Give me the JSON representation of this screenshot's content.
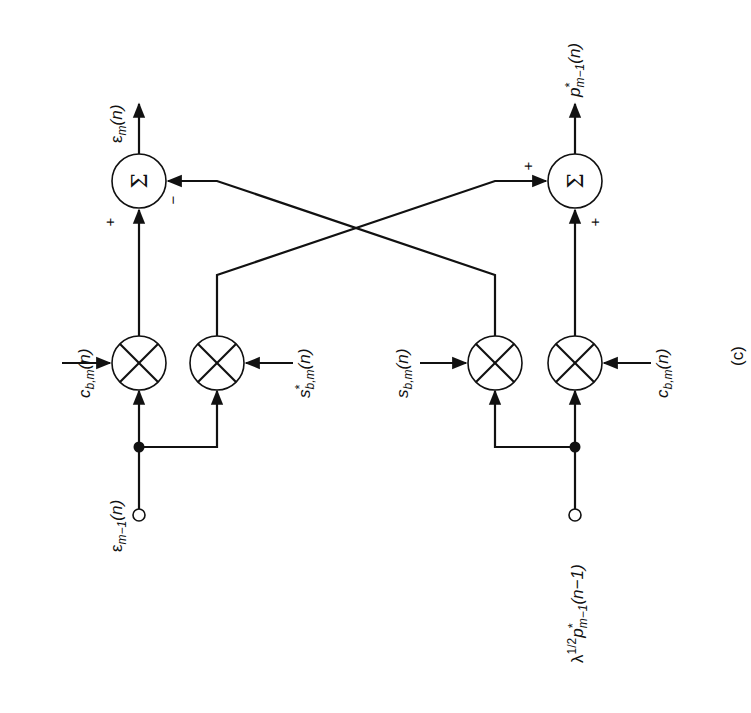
{
  "figure": {
    "panel_label": "(c)",
    "orientation": "rotated 90 degrees counter-clockwise",
    "colors": {
      "ink": "#111111",
      "background": "#ffffff"
    }
  },
  "inputs": {
    "top": {
      "label": "ε m−1(n)",
      "base": "ε",
      "sub": "m−1",
      "arg": "(n)"
    },
    "bottom": {
      "label": "λ1/2 p*m−1(n−1)",
      "pre": "λ",
      "sup": "1/2",
      "base": "p",
      "star": "*",
      "sub": "m−1",
      "arg": "(n−1)"
    }
  },
  "outputs": {
    "top": {
      "label": "ε m(n)",
      "base": "ε",
      "sub": "m",
      "arg": "(n)"
    },
    "bottom": {
      "label": "p*m−1(n)",
      "base": "p",
      "star": "*",
      "sub": "m−1",
      "arg": "(n)"
    }
  },
  "multipliers": [
    {
      "id": "mult-1",
      "coef": {
        "base": "c",
        "sub": "b,m",
        "arg": "(n)",
        "star": ""
      }
    },
    {
      "id": "mult-2",
      "coef": {
        "base": "s",
        "sub": "b,m",
        "arg": "(n)",
        "star": "*"
      }
    },
    {
      "id": "mult-3",
      "coef": {
        "base": "s",
        "sub": "b,m",
        "arg": "(n)",
        "star": ""
      }
    },
    {
      "id": "mult-4",
      "coef": {
        "base": "c",
        "sub": "b,m",
        "arg": "(n)",
        "star": ""
      }
    }
  ],
  "summers": [
    {
      "id": "sum-top",
      "symbol": "Σ",
      "signs": {
        "direct": "+",
        "cross": "−"
      }
    },
    {
      "id": "sum-bottom",
      "symbol": "Σ",
      "signs": {
        "direct": "+",
        "cross": "+"
      }
    }
  ]
}
